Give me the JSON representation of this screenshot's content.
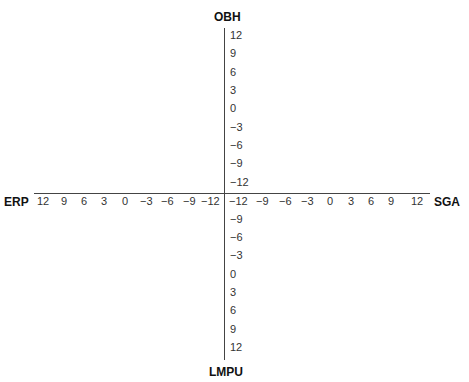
{
  "diagram": {
    "axes": {
      "top": "OBH",
      "bottom": "LMPU",
      "left": "ERP",
      "right": "SGA"
    },
    "vertical_upper_ticks": [
      "12",
      "9",
      "6",
      "3",
      "0",
      "−3",
      "−6",
      "−9",
      "−12"
    ],
    "vertical_lower_ticks": [
      "−9",
      "−6",
      "−3",
      "0",
      "3",
      "6",
      "9",
      "12"
    ],
    "horizontal_left_ticks": [
      "12",
      "9",
      "6",
      "3",
      "0",
      "−3",
      "−6",
      "−9",
      "−12"
    ],
    "horizontal_right_ticks": [
      "−12",
      "−9",
      "−6",
      "−3",
      "0",
      "3",
      "6",
      "9",
      "12"
    ]
  }
}
